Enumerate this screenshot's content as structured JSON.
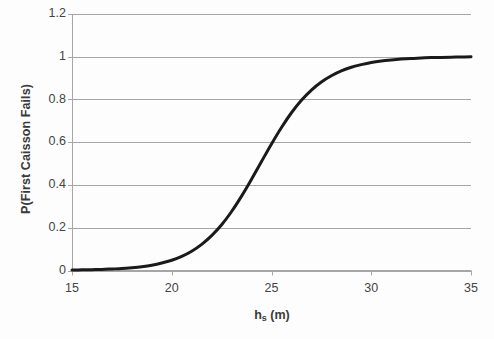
{
  "chart_data": {
    "type": "line",
    "title": "",
    "xlabel": "h_s (m)",
    "xlabel_base": "h",
    "xlabel_sub": "s",
    "xlabel_unit": " (m)",
    "ylabel": "P(First Caisson Fails)",
    "xlim": [
      15,
      35
    ],
    "ylim": [
      0,
      1.2
    ],
    "xticks": [
      "15",
      "20",
      "25",
      "30",
      "35"
    ],
    "xtick_values": [
      15,
      20,
      25,
      30,
      35
    ],
    "yticks": [
      "0",
      "0.2",
      "0.4",
      "0.6",
      "0.8",
      "1",
      "1.2"
    ],
    "ytick_values": [
      0,
      0.2,
      0.4,
      0.6,
      0.8,
      1,
      1.2
    ],
    "grid": "horizontal",
    "legend": "none",
    "series": [
      {
        "name": "P(First Caisson Fails)",
        "color": "#1a1a1a",
        "line_width": 3,
        "x": [
          15,
          15.5,
          16,
          16.5,
          17,
          17.5,
          18,
          18.5,
          19,
          19.5,
          20,
          20.5,
          21,
          21.5,
          22,
          22.5,
          23,
          23.5,
          24,
          24.5,
          25,
          25.5,
          26,
          26.5,
          27,
          27.5,
          28,
          28.5,
          29,
          29.5,
          30,
          30.5,
          31,
          31.5,
          32,
          32.5,
          33,
          33.5,
          34,
          34.5,
          35
        ],
        "values": [
          0.002,
          0.003,
          0.004,
          0.005,
          0.007,
          0.009,
          0.013,
          0.018,
          0.025,
          0.035,
          0.048,
          0.066,
          0.09,
          0.122,
          0.163,
          0.214,
          0.276,
          0.348,
          0.427,
          0.51,
          0.592,
          0.669,
          0.738,
          0.796,
          0.844,
          0.882,
          0.911,
          0.934,
          0.951,
          0.963,
          0.973,
          0.98,
          0.985,
          0.989,
          0.992,
          0.994,
          0.996,
          0.997,
          0.998,
          0.999,
          1.0
        ]
      }
    ],
    "colors": {
      "curve": "#1a1a1a",
      "gridline": "#a6a6a6",
      "axis": "#a6a6a6",
      "text": "#444444",
      "background": "#fdfdfd"
    }
  }
}
